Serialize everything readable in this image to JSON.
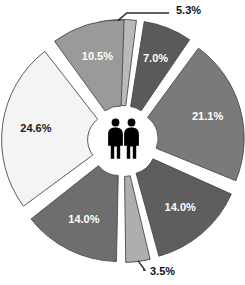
{
  "chart_data": {
    "type": "pie",
    "title": "",
    "subtitle": "",
    "xlabel": "",
    "ylabel": "",
    "legend_position": "none",
    "grid": false,
    "exploded": true,
    "units": "percent",
    "center_icon": "two-person-pictogram",
    "total": 100.0,
    "categories": [
      "5.3%",
      "7.0%",
      "21.1%",
      "14.0%",
      "3.5%",
      "14.0%",
      "24.6%",
      "10.5%"
    ],
    "values": [
      5.3,
      7.0,
      21.1,
      14.0,
      3.5,
      14.0,
      24.6,
      10.5
    ],
    "slices": [
      {
        "label": "5.3%",
        "value": 5.3,
        "color": "#b9b9b9",
        "text_color": "#ffffff",
        "label_placement": "outside",
        "start_angle": -12.0,
        "end_angle": 7.1
      },
      {
        "label": "7.0%",
        "value": 7.0,
        "color": "#5a5a5a",
        "text_color": "#ffffff",
        "label_placement": "inside",
        "start_angle": 9.1,
        "end_angle": 34.3
      },
      {
        "label": "21.1%",
        "value": 21.1,
        "color": "#7a7a7a",
        "text_color": "#ffffff",
        "label_placement": "inside",
        "start_angle": 36.3,
        "end_angle": 112.2
      },
      {
        "label": "14.0%",
        "value": 14.0,
        "color": "#5e5e5e",
        "text_color": "#ffffff",
        "label_placement": "inside",
        "start_angle": 114.2,
        "end_angle": 164.6
      },
      {
        "label": "3.5%",
        "value": 3.5,
        "color": "#aeaeae",
        "text_color": "#ffffff",
        "label_placement": "outside",
        "start_angle": 166.6,
        "end_angle": 179.2
      },
      {
        "label": "14.0%",
        "value": 14.0,
        "color": "#6e6e6e",
        "text_color": "#ffffff",
        "label_placement": "inside",
        "start_angle": 181.2,
        "end_angle": 231.6
      },
      {
        "label": "24.6%",
        "value": 24.6,
        "color": "#f4f4f4",
        "text_color": "#1a1a1a",
        "label_placement": "inside",
        "start_angle": 233.6,
        "end_angle": 322.1
      },
      {
        "label": "10.5%",
        "value": 10.5,
        "color": "#9a9a9a",
        "text_color": "#ffffff",
        "label_placement": "inside",
        "start_angle": 324.1,
        "end_angle": 362.0
      }
    ],
    "callouts": [
      {
        "label": "5.3%",
        "x": 176,
        "y": 11
      },
      {
        "label": "3.5%",
        "x": 150,
        "y": 272
      }
    ],
    "colors": {
      "background": "#ffffff",
      "outline": "#4a4a4a",
      "leader": "#2b2b2b",
      "center_icon": "#000000"
    }
  }
}
